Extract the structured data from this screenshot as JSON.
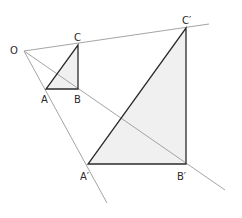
{
  "diagram": {
    "colors": {
      "ray": "#9a9a9a",
      "edge": "#2b2b2b",
      "fill": "#f0f0f0",
      "label": "#2a2a2a"
    },
    "labels": {
      "O": "O",
      "A": "A",
      "B": "B",
      "C": "C",
      "A_prime": "A′",
      "B_prime": "B′",
      "C_prime": "C′"
    },
    "points": {
      "O": [
        24,
        51
      ],
      "A": [
        46,
        89
      ],
      "B": [
        78,
        89
      ],
      "C": [
        78,
        45
      ],
      "A_prime": [
        88,
        164
      ],
      "B_prime": [
        186,
        164
      ],
      "C_prime": [
        186,
        28
      ]
    },
    "rays": [
      {
        "name": "ray-OC",
        "from": "O",
        "to": [
          209,
          24
        ]
      },
      {
        "name": "ray-OA",
        "from": "O",
        "to": [
          107,
          203
        ]
      },
      {
        "name": "ray-OB",
        "from": "O",
        "to": [
          225,
          190
        ]
      }
    ],
    "triangles": [
      {
        "name": "triangle-ABC",
        "vertices": [
          "A",
          "B",
          "C"
        ]
      },
      {
        "name": "triangle-A'B'C'",
        "vertices": [
          "A_prime",
          "B_prime",
          "C_prime"
        ]
      }
    ]
  }
}
